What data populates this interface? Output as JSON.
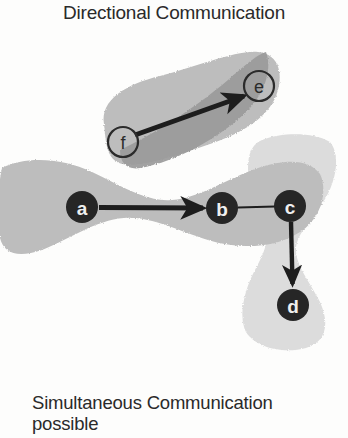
{
  "figure": {
    "title": "Directional Communication",
    "caption_line1": "Simultaneous Communication",
    "caption_line2": "possible",
    "type": "node-link communication diagram",
    "background_color": "#fdfdfc",
    "ink_color": "#232323"
  },
  "palette": {
    "blob_light": "#dcdcdc",
    "blob_medium": "#bdbdbd",
    "blob_dark": "#9a9a9a",
    "node_fill_dark": "#262626",
    "node_fill_open": "none",
    "node_stroke_open": "#2b2b2b",
    "edge_color": "#1d1d1d"
  },
  "nodes": [
    {
      "id": "a",
      "label": "a",
      "x": 82,
      "y": 179,
      "r": 16,
      "style": "filled"
    },
    {
      "id": "b",
      "label": "b",
      "x": 222,
      "y": 180,
      "r": 16,
      "style": "filled"
    },
    {
      "id": "c",
      "label": "c",
      "x": 290,
      "y": 178,
      "r": 16,
      "style": "filled"
    },
    {
      "id": "d",
      "label": "d",
      "x": 293,
      "y": 277,
      "r": 16,
      "style": "filled"
    },
    {
      "id": "e",
      "label": "e",
      "x": 259,
      "y": 58,
      "r": 15,
      "style": "open"
    },
    {
      "id": "f",
      "label": "f",
      "x": 123,
      "y": 114,
      "r": 15,
      "style": "open"
    }
  ],
  "edges": [
    {
      "from": "a",
      "to": "b",
      "kind": "directed",
      "arrowhead": true
    },
    {
      "from": "b",
      "to": "c",
      "kind": "undirected",
      "arrowhead": false
    },
    {
      "from": "c",
      "to": "d",
      "kind": "directed",
      "arrowhead": true
    },
    {
      "from": "f",
      "to": "e",
      "kind": "directed",
      "arrowhead": true
    }
  ],
  "regions": [
    {
      "name": "region-ab",
      "shade": "medium",
      "orientation": "horizontal-bowtie",
      "covers": [
        "a",
        "b"
      ]
    },
    {
      "name": "region-cd",
      "shade": "light",
      "orientation": "vertical-bowtie",
      "covers": [
        "c",
        "d"
      ]
    },
    {
      "name": "region-fe",
      "shade": "medium",
      "orientation": "rounded-diagonal",
      "covers": [
        "f",
        "e"
      ]
    },
    {
      "name": "region-fe-cone",
      "shade": "dark",
      "orientation": "diagonal-cone",
      "covers": [
        "f",
        "e"
      ]
    }
  ]
}
